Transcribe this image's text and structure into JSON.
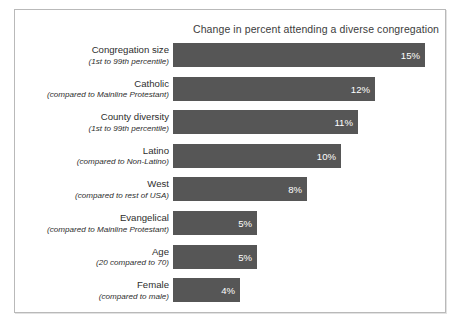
{
  "chart_data": {
    "type": "bar",
    "orientation": "horizontal",
    "title": "Change in percent attending a diverse congregation",
    "xlabel": "",
    "ylabel": "",
    "xlim": [
      0,
      16
    ],
    "grid": false,
    "legend": null,
    "value_suffix": "%",
    "bar_color": "#565656",
    "value_label_color": "#ffffff",
    "categories": [
      "Congregation size",
      "Catholic",
      "County diversity",
      "Latino",
      "West",
      "Evangelical",
      "Age",
      "Female"
    ],
    "category_subtitles": [
      "(1st to 99th percentile)",
      "(compared to Mainline Protestant)",
      "(1st to 99th percentile)",
      "(compared to Non-Latino)",
      "(compared to rest of USA)",
      "(compared to Mainline Protestant)",
      "(20 compared to 70)",
      "(compared to male)"
    ],
    "values": [
      15,
      12,
      11,
      10,
      8,
      5,
      5,
      4
    ],
    "value_labels": [
      "15%",
      "12%",
      "11%",
      "10%",
      "8%",
      "5%",
      "5%",
      "4%"
    ],
    "bars": [
      {
        "label": "Congregation size",
        "sublabel": "(1st to 99th percentile)",
        "value": 15,
        "value_label": "15%"
      },
      {
        "label": "Catholic",
        "sublabel": "(compared to Mainline Protestant)",
        "value": 12,
        "value_label": "12%"
      },
      {
        "label": "County diversity",
        "sublabel": "(1st to 99th percentile)",
        "value": 11,
        "value_label": "11%"
      },
      {
        "label": "Latino",
        "sublabel": "(compared to Non-Latino)",
        "value": 10,
        "value_label": "10%"
      },
      {
        "label": "West",
        "sublabel": "(compared to rest of USA)",
        "value": 8,
        "value_label": "8%"
      },
      {
        "label": "Evangelical",
        "sublabel": "(compared to Mainline Protestant)",
        "value": 5,
        "value_label": "5%"
      },
      {
        "label": "Age",
        "sublabel": "(20 compared to 70)",
        "value": 5,
        "value_label": "5%"
      },
      {
        "label": "Female",
        "sublabel": "(compared to male)",
        "value": 4,
        "value_label": "4%"
      }
    ]
  }
}
